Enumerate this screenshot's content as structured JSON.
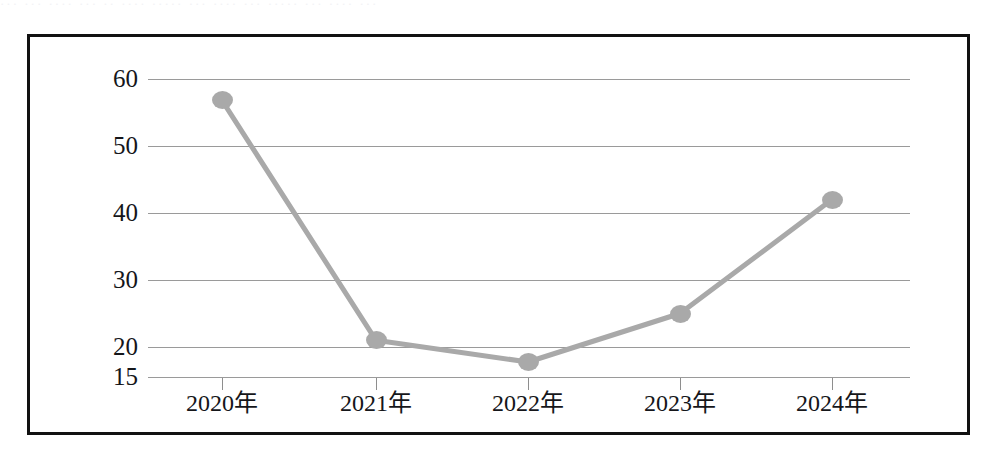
{
  "page": {
    "top_cut_text": "··· ··· ···· ··· ·· ···· ····· ··· ···· ··· ····· ··· ···· ···",
    "frame_color": "#111111",
    "background_color": "#ffffff"
  },
  "chart_data": {
    "type": "line",
    "title": "",
    "subtitle": "",
    "xlabel": "",
    "ylabel": "",
    "categories": [
      "2020年",
      "2021年",
      "2022年",
      "2023年",
      "2024年"
    ],
    "values": [
      56.8,
      21.0,
      17.5,
      25.0,
      42.0
    ],
    "series": [
      {
        "name": "",
        "values": [
          56.8,
          21.0,
          17.5,
          25.0,
          42.0
        ],
        "line_color": "#a9a9a9",
        "marker_color": "#a9a9a9",
        "marker_shape": "circle"
      }
    ],
    "ytick_labels": [
      "60",
      "50",
      "40",
      "30",
      "20",
      "15"
    ],
    "ytick_values": [
      60,
      50,
      40,
      30,
      20,
      15
    ],
    "ylim": [
      15,
      60
    ],
    "grid": true,
    "grid_color": "#9a9a9a",
    "legend": false,
    "legend_position": "none",
    "xtick_labels": [
      "2020年",
      "2021年",
      "2022年",
      "2023年",
      "2024年"
    ]
  }
}
